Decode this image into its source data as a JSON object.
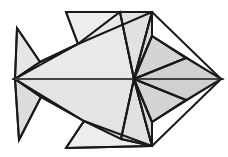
{
  "figure": {
    "style": "low-poly line drawing",
    "orientation": "facing right",
    "background_color": "#ffffff",
    "outline_color": "#1a1a1a",
    "outline_width": 2,
    "canvas": {
      "width": 228,
      "height": 157
    }
  },
  "palette": {
    "outline": "#1a1a1a",
    "thin_line": "#6e6e6e",
    "fill_lightest": "#ffffff",
    "fill_light": "#efefef",
    "fill_mid_light": "#e6e6e6",
    "fill_mid": "#dcdcdc",
    "fill_dark": "#cfcfcf",
    "fill_darkest": "#c4c4c4"
  },
  "vertices": {
    "tail_tip_top": [
      17,
      28
    ],
    "tail_notch": [
      15,
      79
    ],
    "tail_tip_bottom": [
      19,
      140
    ],
    "tail_joint_top": [
      40,
      62
    ],
    "tail_joint_bottom": [
      41,
      97
    ],
    "dorsal_fin_left": [
      66,
      12
    ],
    "dorsal_fin_inner": [
      78,
      44
    ],
    "dorsal_apex_right": [
      152,
      12
    ],
    "ventral_fin_left": [
      66,
      148
    ],
    "ventral_fin_inner": [
      84,
      121
    ],
    "ventral_apex_right": [
      152,
      146
    ],
    "body_hub": [
      134,
      79
    ],
    "spine_front": [
      152,
      79
    ],
    "head_apex_top": [
      152,
      36
    ],
    "head_apex_bottom": [
      152,
      122
    ],
    "nose": [
      221,
      79
    ],
    "head_mid_top": [
      186,
      58
    ],
    "head_mid_bottom": [
      186,
      100
    ],
    "fin_mid_top": [
      120,
      12
    ],
    "fin_mid_bottom": [
      121,
      139
    ]
  },
  "facets": [
    {
      "name": "tail-upper-outer",
      "shade": "#e6e6e6",
      "points": "17,28 40,62 15,79"
    },
    {
      "name": "tail-lower-outer",
      "shade": "#dcdcdc",
      "points": "15,79 41,97 19,140"
    },
    {
      "name": "tail-upper-inner",
      "shade": "#efefef",
      "points": "40,62 78,44 15,79"
    },
    {
      "name": "tail-lower-inner",
      "shade": "#e6e6e6",
      "points": "15,79 41,97 84,121"
    },
    {
      "name": "dorsal-fin",
      "shade": "#ededed",
      "points": "66,12 152,12 120,12 78,44"
    },
    {
      "name": "ventral-fin",
      "shade": "#ededed",
      "points": "66,148 152,146 84,121"
    },
    {
      "name": "body-upper-left",
      "shade": "#e9e9e9",
      "points": "78,44 120,12 134,79 15,79"
    },
    {
      "name": "body-lower-left",
      "shade": "#e4e4e4",
      "points": "15,79 134,79 121,139 84,121"
    },
    {
      "name": "body-upper-mid",
      "shade": "#e1e1e1",
      "points": "120,12 152,12 134,79"
    },
    {
      "name": "body-lower-mid",
      "shade": "#e1e1e1",
      "points": "134,79 152,146 121,139"
    },
    {
      "name": "head-upper-left",
      "shade": "#dcdcdc",
      "points": "152,12 152,36 134,79"
    },
    {
      "name": "head-lower-left",
      "shade": "#dcdcdc",
      "points": "134,79 152,122 152,146"
    },
    {
      "name": "gill-upper",
      "shade": "#d4d4d4",
      "points": "152,36 186,58 134,79"
    },
    {
      "name": "gill-lower",
      "shade": "#d4d4d4",
      "points": "134,79 186,100 152,122"
    },
    {
      "name": "head-upper-right",
      "shade": "#c9c9c9",
      "points": "152,36 221,79 186,58"
    },
    {
      "name": "head-lower-right",
      "shade": "#c9c9c9",
      "points": "186,100 221,79 152,122"
    },
    {
      "name": "cheek-upper",
      "shade": "#d0d0d0",
      "points": "186,58 221,79 134,79"
    },
    {
      "name": "cheek-lower",
      "shade": "#d0d0d0",
      "points": "134,79 221,79 186,100"
    }
  ],
  "edges": [
    {
      "name": "outline-tail-top",
      "d": "M17,28 L40,62",
      "width": 2
    },
    {
      "name": "outline-tail-notch-top",
      "d": "M40,62 L15,79",
      "width": 2
    },
    {
      "name": "outline-tail-notch-bottom",
      "d": "M15,79 L41,97",
      "width": 2
    },
    {
      "name": "outline-tail-bottom",
      "d": "M41,97 L19,140",
      "width": 2
    },
    {
      "name": "outline-tail-back-top",
      "d": "M17,28 L15,79",
      "width": 2
    },
    {
      "name": "outline-tail-back-bottom",
      "d": "M15,79 L19,140",
      "width": 2
    },
    {
      "name": "crease-tail-upper",
      "d": "M40,62 L78,44",
      "width": 2
    },
    {
      "name": "crease-tail-lower",
      "d": "M41,97 L84,121",
      "width": 2
    },
    {
      "name": "outline-dorsal-left",
      "d": "M66,12 L78,44",
      "width": 2
    },
    {
      "name": "outline-dorsal-top",
      "d": "M66,12 L152,12",
      "width": 2
    },
    {
      "name": "crease-dorsal-inner",
      "d": "M78,44 L152,12",
      "width": 2
    },
    {
      "name": "outline-ventral-left",
      "d": "M66,148 L84,121",
      "width": 2
    },
    {
      "name": "outline-ventral-bottom",
      "d": "M66,148 L152,146",
      "width": 2
    },
    {
      "name": "crease-ventral-inner",
      "d": "M84,121 L152,146",
      "width": 2
    },
    {
      "name": "spine-line",
      "d": "M15,79 L221,79",
      "width": 1.1,
      "thin": true
    },
    {
      "name": "body-ray-up-left",
      "d": "M134,79 L120,12",
      "width": 2
    },
    {
      "name": "body-ray-down-left",
      "d": "M134,79 L121,139",
      "width": 2
    },
    {
      "name": "body-ray-up-right",
      "d": "M134,79 L152,12",
      "width": 2
    },
    {
      "name": "body-ray-down-right",
      "d": "M134,79 L152,146",
      "width": 2
    },
    {
      "name": "gill-ray-up",
      "d": "M134,79 L186,58",
      "width": 2
    },
    {
      "name": "gill-ray-down",
      "d": "M134,79 L186,100",
      "width": 2
    },
    {
      "name": "head-edge-top",
      "d": "M152,12 L221,79",
      "width": 2
    },
    {
      "name": "head-edge-bottom",
      "d": "M152,146 L221,79",
      "width": 2
    },
    {
      "name": "head-crease-top",
      "d": "M152,36 L186,58",
      "width": 2
    },
    {
      "name": "head-crease-bottom",
      "d": "M152,122 L186,100",
      "width": 2
    },
    {
      "name": "head-crease-top-in",
      "d": "M152,36 L134,79",
      "width": 2
    },
    {
      "name": "head-crease-bottom-in",
      "d": "M152,122 L134,79",
      "width": 2
    },
    {
      "name": "fin-ray-top",
      "d": "M120,12 L152,12",
      "width": 2
    },
    {
      "name": "fin-ray-bottom",
      "d": "M121,139 L152,146",
      "width": 2
    }
  ]
}
